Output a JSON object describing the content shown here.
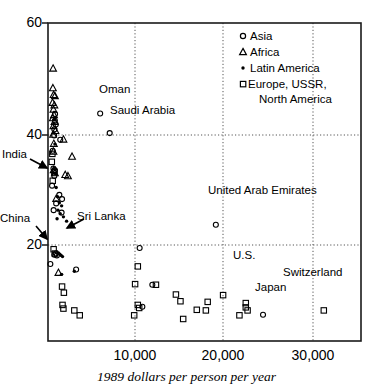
{
  "chart_data": {
    "type": "scatter",
    "title": "",
    "xlabel": "1989 dollars per person per year",
    "ylabel": "",
    "xlim": [
      0,
      34500
    ],
    "ylim": [
      8,
      60
    ],
    "grid": "dotted gridlines at x = 10,000 / 20,000 / 30,000 and y = 20 / 40",
    "xticks": [
      10000,
      20000,
      30000
    ],
    "xtick_labels": [
      "10,000",
      "20,000",
      "30,000"
    ],
    "yticks": [
      20,
      40,
      60
    ],
    "ytick_labels": [
      "20",
      "40",
      "60"
    ],
    "legend": {
      "position": "top-right inside axes",
      "entries": [
        {
          "label": "Asia",
          "marker": "open-circle"
        },
        {
          "label": "Africa",
          "marker": "open-triangle"
        },
        {
          "label": "Latin America",
          "marker": "filled-dot"
        },
        {
          "label": "Europe, USSR,",
          "marker": "open-square"
        },
        {
          "label": "North America",
          "marker": "none"
        }
      ]
    },
    "annotations": [
      {
        "text": "Oman",
        "x": 5750,
        "y": 45.2,
        "arrow": false
      },
      {
        "text": "Saudi Arabia",
        "x": 6800,
        "y": 42.0,
        "arrow": false
      },
      {
        "text": "United Arab Emirates",
        "x": 18500,
        "y": 28.0,
        "arrow": false
      },
      {
        "text": "India",
        "x": 450,
        "y": 33.4,
        "arrow": true
      },
      {
        "text": "China",
        "x": 260,
        "y": 20.6,
        "arrow": true
      },
      {
        "text": "Sri Lanka",
        "x": 900,
        "y": 22.4,
        "arrow": true
      },
      {
        "text": "U.S.",
        "x": 21700,
        "y": 15.2,
        "arrow": false
      },
      {
        "text": "Switzerland",
        "x": 30300,
        "y": 13.3,
        "arrow": false
      },
      {
        "text": "Japan",
        "x": 23700,
        "y": 12.5,
        "arrow": false
      }
    ],
    "series": [
      {
        "name": "Asia",
        "marker": "open-circle",
        "points": [
          [
            780,
            45.1
          ],
          [
            760,
            44.0
          ],
          [
            860,
            43.4
          ],
          [
            700,
            42.6
          ],
          [
            680,
            41.6
          ],
          [
            1350,
            40.9
          ],
          [
            520,
            39.1
          ],
          [
            600,
            36.2
          ],
          [
            760,
            35.9
          ],
          [
            700,
            35.0
          ],
          [
            450,
            33.4
          ],
          [
            1250,
            31.9
          ],
          [
            1550,
            31.2
          ],
          [
            900,
            30.5
          ],
          [
            620,
            29.4
          ],
          [
            1500,
            29.0
          ],
          [
            260,
            20.6
          ],
          [
            860,
            22.3
          ],
          [
            700,
            22.1
          ],
          [
            980,
            22.0
          ],
          [
            3100,
            19.7
          ],
          [
            5750,
            45.2
          ],
          [
            6800,
            42.0
          ],
          [
            18500,
            27.0
          ],
          [
            10100,
            23.2
          ],
          [
            11500,
            17.2
          ],
          [
            10400,
            13.6
          ],
          [
            23700,
            12.3
          ]
        ]
      },
      {
        "name": "Africa",
        "marker": "open-triangle",
        "points": [
          [
            560,
            52.6
          ],
          [
            540,
            49.4
          ],
          [
            620,
            48.3
          ],
          [
            760,
            48.1
          ],
          [
            500,
            47.0
          ],
          [
            700,
            46.6
          ],
          [
            600,
            45.9
          ],
          [
            660,
            45.0
          ],
          [
            540,
            44.5
          ],
          [
            720,
            43.9
          ],
          [
            600,
            43.2
          ],
          [
            820,
            42.4
          ],
          [
            560,
            41.8
          ],
          [
            1700,
            41.0
          ],
          [
            640,
            40.3
          ],
          [
            600,
            39.0
          ],
          [
            2650,
            38.2
          ],
          [
            620,
            36.0
          ],
          [
            760,
            35.5
          ],
          [
            1900,
            35.2
          ],
          [
            2200,
            35.0
          ],
          [
            900,
            31.3
          ],
          [
            1150,
            19.2
          ]
        ]
      },
      {
        "name": "Latin America",
        "marker": "filled-dot",
        "points": [
          [
            700,
            44.2
          ],
          [
            640,
            42.0
          ],
          [
            760,
            40.2
          ],
          [
            820,
            35.4
          ],
          [
            900,
            33.1
          ],
          [
            1050,
            31.6
          ],
          [
            1250,
            30.6
          ],
          [
            1500,
            30.1
          ],
          [
            1100,
            29.4
          ],
          [
            1350,
            28.8
          ],
          [
            1700,
            28.3
          ],
          [
            2050,
            27.6
          ],
          [
            1000,
            28.0
          ],
          [
            1150,
            22.4
          ],
          [
            1300,
            22.2
          ],
          [
            1450,
            22.0
          ],
          [
            1600,
            21.8
          ],
          [
            1500,
            18.9
          ],
          [
            2900,
            19.4
          ]
        ]
      },
      {
        "name": "Europe, USSR, North America",
        "marker": "open-square",
        "points": [
          [
            480,
            38.6
          ],
          [
            420,
            37.3
          ],
          [
            700,
            35.6
          ],
          [
            520,
            34.2
          ],
          [
            620,
            23.0
          ],
          [
            760,
            22.3
          ],
          [
            1550,
            16.9
          ],
          [
            1750,
            15.9
          ],
          [
            1600,
            13.9
          ],
          [
            1700,
            13.3
          ],
          [
            2900,
            13.0
          ],
          [
            3500,
            12.2
          ],
          [
            9600,
            17.3
          ],
          [
            9900,
            20.2
          ],
          [
            9900,
            13.9
          ],
          [
            10050,
            13.4
          ],
          [
            9500,
            12.2
          ],
          [
            11900,
            17.2
          ],
          [
            14100,
            15.6
          ],
          [
            14600,
            14.5
          ],
          [
            14900,
            11.6
          ],
          [
            16400,
            13.1
          ],
          [
            17600,
            14.4
          ],
          [
            17400,
            13.0
          ],
          [
            19300,
            15.5
          ],
          [
            21100,
            12.2
          ],
          [
            21800,
            14.2
          ],
          [
            21800,
            13.5
          ],
          [
            22000,
            13.0
          ],
          [
            30400,
            13.0
          ]
        ]
      }
    ]
  },
  "axes": {
    "x_tick_labels": [
      "10,000",
      "20,000",
      "30,000"
    ],
    "y_tick_labels": [
      "60",
      "40",
      "20"
    ],
    "x_axis_title": "1989 dollars per person per year"
  },
  "legend": {
    "items": [
      {
        "label": "Asia"
      },
      {
        "label": "Africa"
      },
      {
        "label": "Latin America"
      },
      {
        "label": "Europe, USSR,"
      },
      {
        "label": "North America"
      }
    ]
  },
  "labels": {
    "oman": "Oman",
    "saudi_arabia": "Saudi Arabia",
    "united_arab_emirates": "United Arab Emirates",
    "india": "India",
    "china": "China",
    "sri_lanka": "Sri Lanka",
    "us": "U.S.",
    "switzerland": "Switzerland",
    "japan": "Japan"
  }
}
